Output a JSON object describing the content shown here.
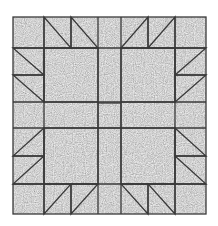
{
  "diagram": {
    "title": "Bear's Paw quilt block",
    "type": "quilt-block",
    "colors": {
      "background": "#ffffff",
      "fabric_light": "#ffffff",
      "fabric_dark": "#a3a3a3",
      "seam_line": "#3a3a3a"
    },
    "bounds": {
      "x": 13,
      "y": 17,
      "width": 193,
      "height": 197
    },
    "grid_x": [
      13,
      44,
      71,
      98,
      121,
      148,
      175,
      206
    ],
    "grid_y": [
      17,
      48,
      75,
      102,
      128,
      156,
      184,
      214
    ],
    "center_square": {
      "x": 98,
      "y": 103,
      "width": 23,
      "height": 25
    },
    "paws": [
      {
        "name": "top-left",
        "pad": [
          44,
          48,
          98,
          102
        ],
        "claws": [
          [
            [
              44,
              17
            ],
            [
              44,
              48
            ],
            [
              71,
              48
            ]
          ],
          [
            [
              71,
              17
            ],
            [
              71,
              48
            ],
            [
              98,
              48
            ]
          ],
          [
            [
              13,
              48
            ],
            [
              44,
              48
            ],
            [
              44,
              75
            ]
          ],
          [
            [
              13,
              75
            ],
            [
              44,
              75
            ],
            [
              44,
              102
            ]
          ]
        ]
      },
      {
        "name": "top-right",
        "pad": [
          121,
          48,
          175,
          102
        ],
        "claws": [
          [
            [
              121,
              48
            ],
            [
              148,
              17
            ],
            [
              148,
              48
            ]
          ],
          [
            [
              148,
              48
            ],
            [
              175,
              17
            ],
            [
              175,
              48
            ]
          ],
          [
            [
              175,
              48
            ],
            [
              206,
              48
            ],
            [
              175,
              75
            ]
          ],
          [
            [
              175,
              75
            ],
            [
              206,
              75
            ],
            [
              175,
              102
            ]
          ]
        ]
      },
      {
        "name": "bottom-left",
        "pad": [
          44,
          128,
          98,
          184
        ],
        "claws": [
          [
            [
              44,
              128
            ],
            [
              44,
              156
            ],
            [
              13,
              156
            ]
          ],
          [
            [
              44,
              156
            ],
            [
              44,
              184
            ],
            [
              13,
              184
            ]
          ],
          [
            [
              44,
              184
            ],
            [
              71,
              184
            ],
            [
              44,
              214
            ]
          ],
          [
            [
              71,
              184
            ],
            [
              98,
              184
            ],
            [
              71,
              214
            ]
          ]
        ]
      },
      {
        "name": "bottom-right",
        "pad": [
          121,
          128,
          175,
          184
        ],
        "claws": [
          [
            [
              175,
              128
            ],
            [
              175,
              156
            ],
            [
              206,
              156
            ]
          ],
          [
            [
              175,
              156
            ],
            [
              175,
              184
            ],
            [
              206,
              184
            ]
          ],
          [
            [
              121,
              184
            ],
            [
              148,
              184
            ],
            [
              148,
              214
            ]
          ],
          [
            [
              148,
              184
            ],
            [
              175,
              184
            ],
            [
              175,
              214
            ]
          ]
        ]
      }
    ]
  }
}
